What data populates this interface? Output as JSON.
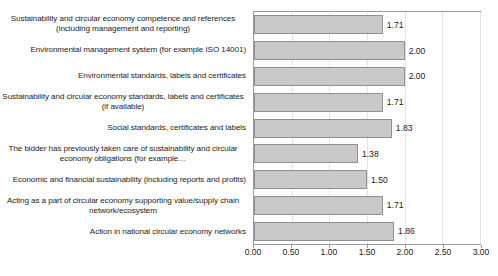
{
  "chart_data": {
    "type": "bar",
    "orientation": "horizontal",
    "title": "",
    "subtitle": "",
    "xlabel": "",
    "ylabel": "",
    "xlim": [
      0.0,
      3.0
    ],
    "xticks": [
      "0.00",
      "0.50",
      "1.00",
      "1.50",
      "2.00",
      "2.50",
      "3.00"
    ],
    "xtick_values": [
      0.0,
      0.5,
      1.0,
      1.5,
      2.0,
      2.5,
      3.0
    ],
    "grid": true,
    "legend": false,
    "bar_color": "#c9c9c9",
    "bar_border_color": "#8f8f8f",
    "categories": [
      "Sustainability and circular economy competence and references (including management and reporting)",
      "Environmental management system (for example ISO 14001)",
      "Environmental standards, labels and certificates",
      "Sustainability and circular economy standards, labels and certificates (if available)",
      "Social standards, certificates and labels",
      "The bidder has previously taken care of sustainability and circular economy obligations (for example…",
      "Economic and financial sustainability (including reports and profits)",
      "Acting as a part of circular economy supporting value/supply chain network/ecosystem",
      "Action in national circular economy networks"
    ],
    "values": [
      1.71,
      2.0,
      2.0,
      1.71,
      1.83,
      1.38,
      1.5,
      1.71,
      1.86
    ],
    "data_labels": [
      "1.71",
      "2.00",
      "2.00",
      "1.71",
      "1.83",
      "1.38",
      "1.50",
      "1.71",
      "1.86"
    ]
  }
}
